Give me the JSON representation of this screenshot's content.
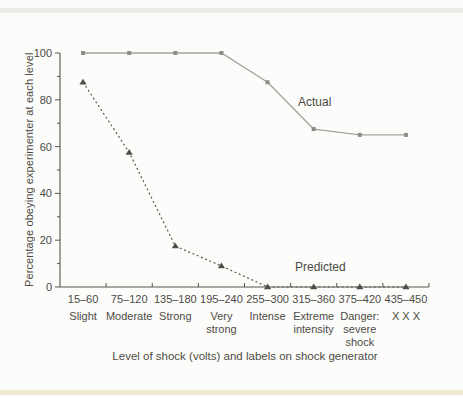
{
  "colors": {
    "background": "#fcfcfa",
    "top_band": "#ebebe7",
    "bottom_band": "#edead1",
    "axis": "#55544e",
    "text": "#4c4b46"
  },
  "chart_data": {
    "type": "line",
    "title": "",
    "xlabel": "Level of shock (volts) and labels on shock generator",
    "ylabel": "Percentage obeying experimenter at each level",
    "ylim": [
      0,
      100
    ],
    "grid": false,
    "legend_position": "inline-annotations",
    "y_major_ticks": [
      0,
      20,
      40,
      60,
      80,
      100
    ],
    "y_minor_ticks": [
      10,
      30,
      50,
      70,
      90
    ],
    "categories_volts": [
      "15–60",
      "75–120",
      "135–180",
      "195–240",
      "255–300",
      "315–360",
      "375–420",
      "435–450"
    ],
    "categories_labels": [
      [
        "Slight"
      ],
      [
        "Moderate"
      ],
      [
        "Strong"
      ],
      [
        "Very",
        "strong"
      ],
      [
        "Intense"
      ],
      [
        "Extreme",
        "intensity"
      ],
      [
        "Danger:",
        "severe",
        "shock"
      ],
      [
        "X X X"
      ]
    ],
    "series": [
      {
        "name": "Actual",
        "line_style": "solid",
        "marker": "square",
        "color": "#a2a29f",
        "marker_color": "#8d8d8a",
        "values": [
          100,
          100,
          100,
          100,
          87.5,
          67.5,
          65,
          65
        ]
      },
      {
        "name": "Predicted",
        "line_style": "dotted",
        "marker": "triangle",
        "color": "#5a5953",
        "marker_color": "#4e4d47",
        "values": [
          87.5,
          57.5,
          17.5,
          9,
          0,
          0,
          0,
          0
        ]
      }
    ],
    "annotations": [
      {
        "text": "Actual"
      },
      {
        "text": "Predicted"
      }
    ]
  }
}
